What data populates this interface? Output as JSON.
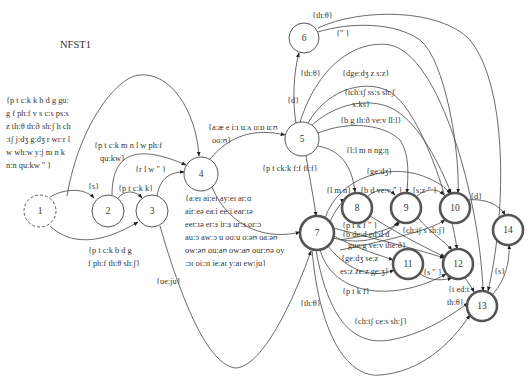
{
  "title": "NFST1",
  "states": [
    {
      "id": "1",
      "x": 40,
      "y": 211,
      "r": 16,
      "type": "start"
    },
    {
      "id": "2",
      "x": 108,
      "y": 211,
      "r": 16,
      "type": "normal"
    },
    {
      "id": "3",
      "x": 152,
      "y": 211,
      "r": 16,
      "type": "normal"
    },
    {
      "id": "4",
      "x": 201,
      "y": 174,
      "r": 17,
      "type": "normal"
    },
    {
      "id": "5",
      "x": 302,
      "y": 139,
      "r": 17,
      "type": "normal"
    },
    {
      "id": "6",
      "x": 304,
      "y": 38,
      "r": 15,
      "type": "normal"
    },
    {
      "id": "7",
      "x": 317,
      "y": 233,
      "r": 17,
      "type": "final"
    },
    {
      "id": "8",
      "x": 357,
      "y": 208,
      "r": 15,
      "type": "final"
    },
    {
      "id": "9",
      "x": 406,
      "y": 208,
      "r": 15,
      "type": "final"
    },
    {
      "id": "10",
      "x": 455,
      "y": 208,
      "r": 15,
      "type": "final"
    },
    {
      "id": "11",
      "x": 408,
      "y": 264,
      "r": 15,
      "type": "final"
    },
    {
      "id": "12",
      "x": 458,
      "y": 264,
      "r": 15,
      "type": "final"
    },
    {
      "id": "13",
      "x": 482,
      "y": 306,
      "r": 15,
      "type": "final"
    },
    {
      "id": "14",
      "x": 508,
      "y": 230,
      "r": 15,
      "type": "final"
    }
  ],
  "edges": [
    {
      "from": "1",
      "to": "4",
      "label_lines": [
        "{p t c:k k b d g gu:",
        "g f ph:f v s c:s ps:s",
        "z th:θ th:ð sh:ʃ h ch",
        ":tʃ j:dʒ g:dʒ r wr:r l",
        " w wh:w y:j m n k",
        "n:n qu:kw \" }"
      ]
    },
    {
      "from": "1",
      "to": "2",
      "label_lines": [
        "{s}"
      ]
    },
    {
      "from": "1",
      "to": "3",
      "label_lines": [
        "{p t c:k b d g",
        " f  ph:f th:θ sh:ʃ}"
      ]
    },
    {
      "from": "2",
      "to": "3",
      "label_lines": [
        "{p t c:k k}"
      ]
    },
    {
      "from": "2",
      "to": "4",
      "label_lines": [
        "{p t c:k m n l w ph:f",
        "qu:kw}"
      ]
    },
    {
      "from": "3",
      "to": "4",
      "label_lines": [
        "{r l w \" }"
      ]
    },
    {
      "from": "3",
      "to": "7",
      "label_lines": [
        "{ue:ju}"
      ]
    },
    {
      "from": "4",
      "to": "5",
      "label_lines": [
        "{a:æ e i:ɪ u:ʌ o:ɒ u:ʊ",
        "oo:ʊ}"
      ]
    },
    {
      "from": "4",
      "to": "7",
      "label_lines": [
        "{a:eɪ ai:eɪ ay:eɪ ar:ɑ",
        "air:eə ea:i ee:i ear:ɪə",
        "eer:ɪə er:ɜ ir:ɜ ur:ɜ or:ɔ",
        "au:ɔ aw:ɔ u oo:u o:əʊ oa:əʊ",
        "ow:əʊ ou:aʊ ow:aʊ our:ʊə oy",
        ":ɔɪ oi:ɔɪ ie:aɪ y:aɪ ew:ju}"
      ]
    },
    {
      "from": "5",
      "to": "6",
      "label_lines": [
        "{d}"
      ]
    },
    {
      "from": "5",
      "to": "7",
      "label_lines": [
        "{p t ck:k f:f ff:f}"
      ]
    },
    {
      "from": "5",
      "to": "8",
      "label_lines": [
        "{l:l m n ng:ŋ"
      ]
    },
    {
      "from": "5",
      "to": "9",
      "label_lines": [
        "{b g th:ð ve:v ll:l}"
      ]
    },
    {
      "from": "5",
      "to": "10",
      "label_lines": [
        "{tch:tʃ ss:s sh:ʃ",
        "x:ks}"
      ]
    },
    {
      "from": "5",
      "to": "12",
      "label_lines": [
        "{dge:dʒ z s:z}"
      ]
    },
    {
      "from": "5",
      "to": "13",
      "label_lines": [
        "{th:θ}"
      ]
    },
    {
      "from": "6",
      "to": "10",
      "label_lines": [
        "{\" }"
      ]
    },
    {
      "from": "6",
      "to": "13",
      "label_lines": [
        "{th:θ}"
      ]
    },
    {
      "from": "7",
      "to": "8",
      "label_lines": [
        "{l m n}"
      ]
    },
    {
      "from": "7",
      "to": "9",
      "label_lines": [
        "{p t k f \" }",
        "{b de:d ed:d d"
      ]
    },
    {
      "from": "7",
      "to": "10",
      "label_lines": [
        "{ge:dʒ}"
      ]
    },
    {
      "from": "7",
      "to": "11",
      "label_lines": [
        "gue:g ve:v the:ð}",
        "{ge:dʒ se:z",
        "es:z ze:z ge:ʒ}"
      ]
    },
    {
      "from": "7",
      "to": "12",
      "label_lines": [
        "{p t k f}"
      ]
    },
    {
      "from": "7",
      "to": "13",
      "label_lines": [
        "{ch:tʃ ce:s sh:ʃ}"
      ]
    },
    {
      "from": "7",
      "to": "13b",
      "label_lines": [
        "{th:θ}"
      ]
    },
    {
      "from": "8",
      "to": "9",
      "label_lines": [
        "{b d ve:v \" }"
      ]
    },
    {
      "from": "9",
      "to": "10",
      "label_lines": [
        "{s:z \" }"
      ]
    },
    {
      "from": "9",
      "to": "12",
      "label_lines": [
        "{ch:tʃ s sh:ʃ}"
      ]
    },
    {
      "from": "10",
      "to": "14",
      "label_lines": [
        "{d}"
      ]
    },
    {
      "from": "11",
      "to": "12",
      "label_lines": [
        "{s \" }"
      ]
    },
    {
      "from": "12",
      "to": "13",
      "label_lines": [
        "{t ed:t",
        "th:θ}"
      ]
    },
    {
      "from": "13",
      "to": "14",
      "label_lines": [
        "{s}"
      ]
    }
  ]
}
